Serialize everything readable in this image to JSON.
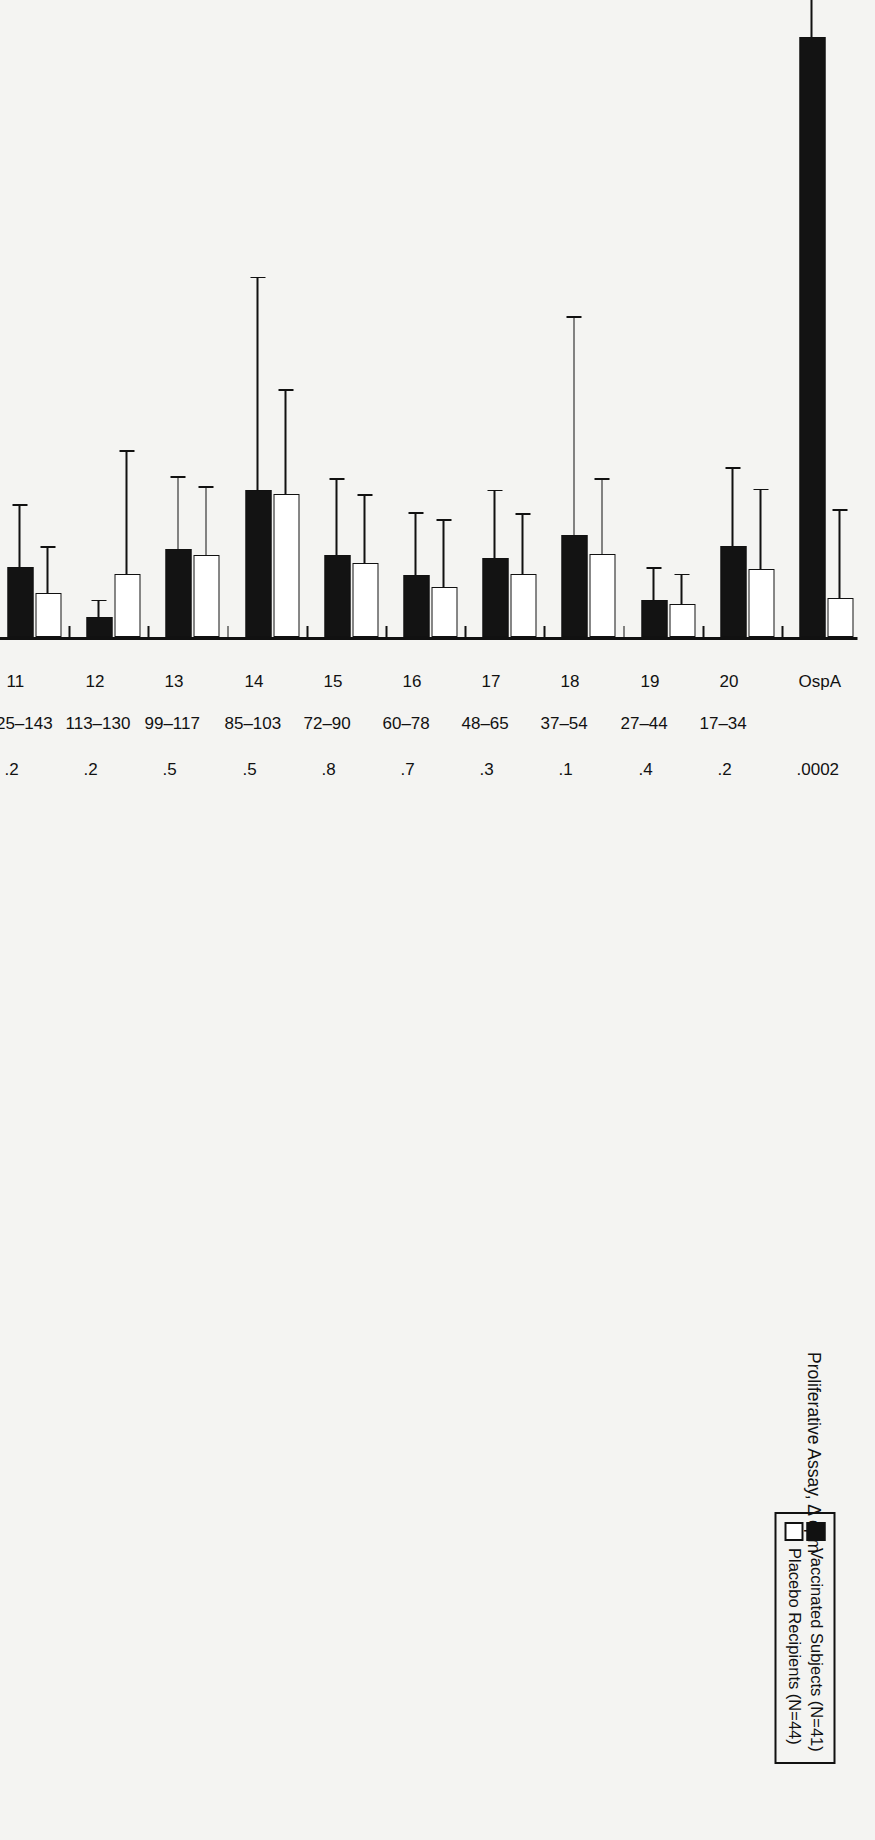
{
  "legend": {
    "items": [
      {
        "label": "Vaccinated Subjects (N=41)",
        "marker": "filled-square",
        "color": "#131313"
      },
      {
        "label": "Placebo Recipients (N=44)",
        "marker": "open-square",
        "color": "#ffffff"
      }
    ]
  },
  "axis_title": "Proliferative Assay, Δ cpm",
  "row_headers": {
    "peptide": "Peptide",
    "amino_acid": "Amino acid No.",
    "p_value": "P value"
  },
  "chart_data": {
    "type": "bar",
    "orientation": "horizontal",
    "title": "",
    "xlabel": "Proliferative Assay, Δ cpm",
    "ylabel": "Peptide",
    "xlim": [
      0,
      6500
    ],
    "ticks": [
      0,
      1500,
      3000,
      4500,
      6000
    ],
    "tick_labels": [
      "0",
      "1500",
      "3000",
      "4500",
      "6000"
    ],
    "grid": false,
    "legend_position": "top-left",
    "categories": [
      "OspA",
      "20",
      "19",
      "18",
      "17",
      "16",
      "15",
      "14",
      "13",
      "12",
      "11",
      "10",
      "9",
      "8",
      "7",
      "6",
      "5",
      "4",
      "3",
      "2",
      "1"
    ],
    "amino_acid_no": [
      "",
      "17–34",
      "27–44",
      "37–54",
      "48–65",
      "60–78",
      "72–90",
      "85–103",
      "99–117",
      "113–130",
      "125–143",
      "139–156",
      "151–159",
      "165–182",
      "178–195",
      "189–208",
      "204–221",
      "217–247",
      "229–247",
      "243–260",
      "256–273"
    ],
    "p_values": [
      ".0002",
      ".2",
      ".4",
      ".1",
      ".3",
      ".7",
      ".8",
      ".5",
      ".5",
      ".2",
      ".2",
      ".1",
      ".1",
      ".05",
      ".2",
      ".1",
      ".04",
      ".2",
      ".08",
      ".3",
      ".1"
    ],
    "series": [
      {
        "name": "Vaccinated Subjects (N=41)",
        "color": "#131313",
        "values": [
          5290,
          800,
          330,
          900,
          700,
          550,
          720,
          1300,
          780,
          180,
          620,
          730,
          540,
          1540,
          840,
          880,
          420,
          1210,
          1340,
          390,
          1000
        ],
        "errors_upper": [
          6300,
          1500,
          620,
          2830,
          1300,
          1100,
          1400,
          3180,
          1420,
          330,
          1170,
          1270,
          1180,
          5440,
          1930,
          2750,
          1510,
          3340,
          2730,
          630,
          3100
        ]
      },
      {
        "name": "Placebo Recipients (N=44)",
        "color": "#ffffff",
        "values": [
          340,
          600,
          290,
          730,
          560,
          440,
          650,
          1260,
          720,
          560,
          390,
          740,
          380,
          1150,
          720,
          1000,
          170,
          870,
          1000,
          330,
          730
        ]
      }
    ],
    "placebo_errors_upper": [
      1130,
      1310,
      560,
      1400,
      1090,
      1040,
      1260,
      2190,
      1330,
      1650,
      800,
      1350,
      700,
      2180,
      1440,
      1780,
      300,
      2100,
      2140,
      880,
      1820
    ]
  }
}
